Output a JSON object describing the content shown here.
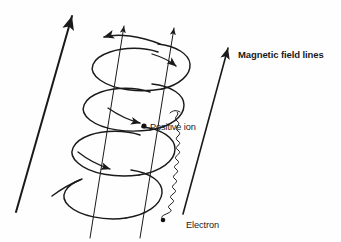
{
  "figure": {
    "background_color": "#fefefe",
    "ink_color": "#1a1a1a",
    "labels": {
      "magnetic_field_lines": "Magnetic field lines",
      "positive_ion": "Positive ion",
      "electron": "Electron"
    },
    "elements": {
      "field_line_count": 4,
      "ion_helix_turns": 3,
      "electron_helix_turns": 11,
      "field_direction": "up-right",
      "ion_marker": "dot",
      "electron_marker": "dot"
    }
  }
}
